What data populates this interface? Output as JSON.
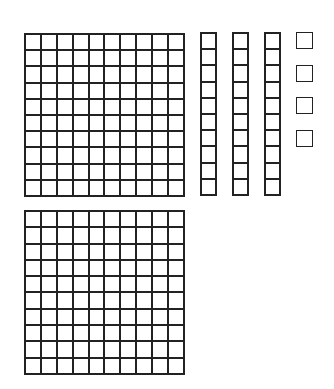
{
  "representation": {
    "hundreds": 2,
    "tens": 3,
    "ones": 4,
    "value": 234
  },
  "blocks": {
    "flats": [
      {
        "x": 24,
        "y": 33,
        "w": 161,
        "h": 164
      },
      {
        "x": 24,
        "y": 210,
        "w": 161,
        "h": 165
      }
    ],
    "rods": [
      {
        "x": 200,
        "y": 32,
        "w": 17,
        "h": 164
      },
      {
        "x": 232,
        "y": 32,
        "w": 17,
        "h": 164
      },
      {
        "x": 264,
        "y": 32,
        "w": 17,
        "h": 164
      }
    ],
    "units": [
      {
        "x": 296,
        "y": 32,
        "w": 17,
        "h": 17
      },
      {
        "x": 296,
        "y": 65,
        "w": 17,
        "h": 17
      },
      {
        "x": 296,
        "y": 97,
        "w": 17,
        "h": 17
      },
      {
        "x": 296,
        "y": 130,
        "w": 17,
        "h": 17
      }
    ]
  },
  "colors": {
    "stroke": "#222222",
    "fill": "#ffffff"
  }
}
